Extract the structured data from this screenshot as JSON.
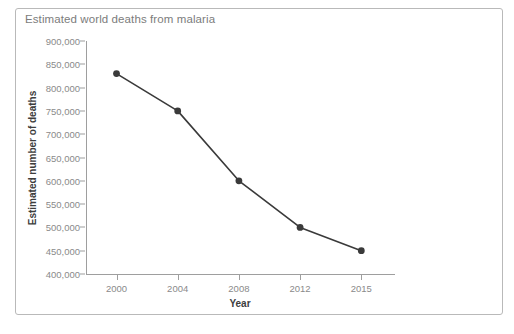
{
  "chart_data": {
    "type": "line",
    "title": "Estimated world deaths from malaria",
    "xlabel": "Year",
    "ylabel": "Estimated number of deaths",
    "categories": [
      "2000",
      "2004",
      "2008",
      "2012",
      "2015"
    ],
    "values": [
      830000,
      750000,
      600000,
      500000,
      450000
    ],
    "series": [
      {
        "name": "Estimated world deaths from malaria",
        "values": [
          830000,
          750000,
          600000,
          500000,
          450000
        ]
      }
    ],
    "ylim": [
      400000,
      900000
    ],
    "ytick_step": 50000,
    "ytick_labels": [
      "900,000",
      "850,000",
      "800,000",
      "750,000",
      "700,000",
      "650,000",
      "600,000",
      "550,000",
      "500,000",
      "450,000",
      "400,000"
    ],
    "ytick_values": [
      900000,
      850000,
      800000,
      750000,
      700000,
      650000,
      600000,
      550000,
      500000,
      450000,
      400000
    ],
    "xtick_labels": [
      "2000",
      "2004",
      "2008",
      "2012",
      "2015"
    ],
    "grid": false,
    "legend": "none",
    "marker": "circle",
    "line_color": "#3a3a3a",
    "marker_color": "#3a3a3a",
    "axis_color": "#9e9e9e",
    "title_color": "#7c7c7c",
    "tick_label_color": "#8a8a8a",
    "axis_title_color": "#3d3d3d",
    "border_color": "#b9b9b9",
    "background_color": "#ffffff"
  }
}
